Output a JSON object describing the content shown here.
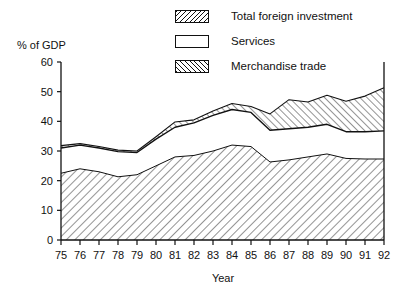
{
  "chart_data": {
    "type": "area",
    "title": "",
    "subtitle": "",
    "xlabel": "Year",
    "ylabel": "% of GDP",
    "stacked": true,
    "grid": false,
    "legend_position": "top-center",
    "xlim": [
      75,
      92
    ],
    "ylim": [
      0,
      60
    ],
    "yticks": [
      0,
      10,
      20,
      30,
      40,
      50,
      60
    ],
    "ytick_labels": [
      "0",
      "10",
      "20",
      "30",
      "40",
      "50",
      "60"
    ],
    "categories": [
      "75",
      "76",
      "77",
      "78",
      "79",
      "80",
      "81",
      "82",
      "83",
      "84",
      "85",
      "86",
      "87",
      "88",
      "89",
      "90",
      "91",
      "92"
    ],
    "xtick_labels": [
      "75",
      "76",
      "77",
      "78",
      "79",
      "80",
      "81",
      "82",
      "83",
      "84",
      "85",
      "86",
      "87",
      "88",
      "89",
      "90",
      "91",
      "92"
    ],
    "series": [
      {
        "name": "Merchandise trade",
        "swatch": "hatch-up-right",
        "stack_order": 1,
        "values": [
          22.5,
          24.0,
          23.0,
          21.3,
          22.0,
          25.0,
          28.0,
          28.5,
          30.0,
          32.0,
          31.5,
          26.3,
          27.0,
          28.0,
          29.0,
          27.5,
          27.3,
          27.3
        ]
      },
      {
        "name": "Services",
        "swatch": "empty-white",
        "stack_order": 2,
        "values": [
          8.5,
          8.0,
          8.0,
          8.5,
          7.5,
          9.0,
          10.0,
          11.0,
          12.0,
          12.0,
          11.5,
          10.7,
          10.5,
          10.0,
          10.0,
          9.0,
          9.2,
          9.5
        ]
      },
      {
        "name": "Total foreign investment",
        "swatch": "hatch-down-right",
        "stack_order": 3,
        "values": [
          0.8,
          0.5,
          0.5,
          0.5,
          0.5,
          0.8,
          1.8,
          1.0,
          1.5,
          2.0,
          2.0,
          5.5,
          9.8,
          8.5,
          9.8,
          10.3,
          12.0,
          14.5
        ]
      }
    ],
    "cumulative": {
      "merchandise_top": [
        22.5,
        24.0,
        23.0,
        21.3,
        22.0,
        25.0,
        28.0,
        28.5,
        30.0,
        32.0,
        31.5,
        26.3,
        27.0,
        28.0,
        29.0,
        27.5,
        27.3,
        27.3
      ],
      "services_top": [
        31.0,
        32.0,
        31.0,
        29.8,
        29.5,
        34.0,
        38.0,
        39.5,
        42.0,
        44.0,
        43.0,
        37.0,
        37.5,
        38.0,
        39.0,
        36.5,
        36.5,
        36.8
      ],
      "total_top": [
        31.8,
        32.5,
        31.5,
        30.3,
        30.0,
        34.8,
        39.8,
        40.5,
        43.5,
        46.0,
        45.0,
        42.5,
        47.3,
        46.5,
        48.8,
        46.8,
        48.5,
        51.3
      ]
    }
  },
  "legend": {
    "items": [
      {
        "label": "Total foreign investment",
        "swatch": "hatch-down-right"
      },
      {
        "label": "Services",
        "swatch": "empty-white"
      },
      {
        "label": "Merchandise trade",
        "swatch": "hatch-up-right"
      }
    ]
  },
  "axes": {
    "y_title": "% of GDP",
    "x_title": "Year"
  },
  "colors": {
    "ink": "#111111",
    "background": "#ffffff"
  }
}
